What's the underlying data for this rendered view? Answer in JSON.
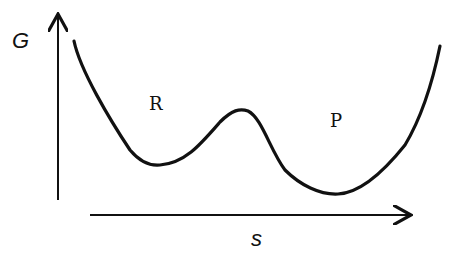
{
  "diagram": {
    "type": "free-energy-profile",
    "y_axis_label": "G",
    "x_axis_label": "s",
    "states": [
      {
        "label": "R",
        "description": "reactant well (left minimum)"
      },
      {
        "label": "P",
        "description": "product well (right minimum, deeper)"
      }
    ],
    "barrier": "single maximum between R and P",
    "colors": {
      "ink": "#111111",
      "background": "#ffffff"
    }
  }
}
